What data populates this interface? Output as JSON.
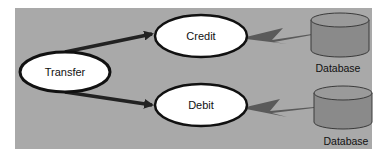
{
  "diagram": {
    "title": "",
    "colors": {
      "panel_bg": "#a9a9a9",
      "node_fill": "#ffffff",
      "node_stroke": "#111111",
      "arrow": "#222222",
      "db_fill": "#8a8a8a",
      "db_top": "#9a9a9a",
      "db_stroke": "#3a3a3a",
      "link": "#5a5a5a"
    },
    "nodes": [
      {
        "id": "transfer",
        "label": "Transfer",
        "shape": "ellipse"
      },
      {
        "id": "credit",
        "label": "Credit",
        "shape": "ellipse"
      },
      {
        "id": "debit",
        "label": "Debit",
        "shape": "ellipse"
      }
    ],
    "databases": [
      {
        "id": "db-credit",
        "label": "Database",
        "shape": "cylinder"
      },
      {
        "id": "db-debit",
        "label": "Database",
        "shape": "cylinder"
      }
    ],
    "edges": [
      {
        "from": "transfer",
        "to": "credit",
        "style": "arrow"
      },
      {
        "from": "transfer",
        "to": "debit",
        "style": "arrow"
      },
      {
        "from": "credit",
        "to": "db-credit",
        "style": "lightning"
      },
      {
        "from": "debit",
        "to": "db-debit",
        "style": "lightning"
      }
    ]
  }
}
